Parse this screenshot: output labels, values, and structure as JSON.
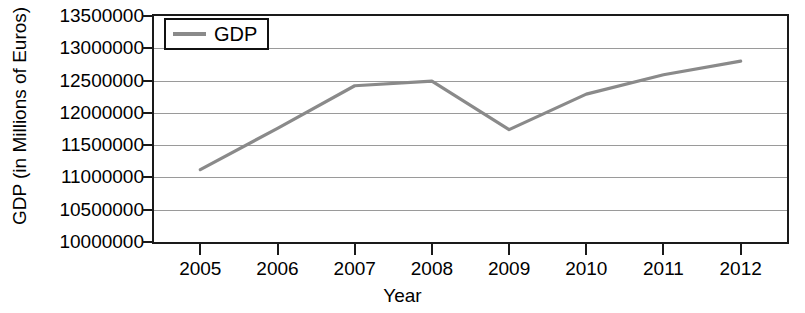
{
  "chart_data": {
    "type": "line",
    "title": "",
    "xlabel": "Year",
    "ylabel": "GDP (in Millions of Euros)",
    "categories": [
      "2005",
      "2006",
      "2007",
      "2008",
      "2009",
      "2010",
      "2011",
      "2012"
    ],
    "x": [
      2005,
      2006,
      2007,
      2008,
      2009,
      2010,
      2011,
      2012
    ],
    "series": [
      {
        "name": "GDP",
        "color": "#8a8a8a",
        "values": [
          11120000,
          11760000,
          12420000,
          12490000,
          11740000,
          12290000,
          12590000,
          12800000
        ]
      }
    ],
    "ylim": [
      10000000,
      13500000
    ],
    "ytick_values": [
      13500000,
      13000000,
      12500000,
      12000000,
      11500000,
      11000000,
      10500000,
      10000000
    ],
    "ytick_labels": [
      "13500000",
      "13000000",
      "12500000",
      "12000000",
      "11500000",
      "11000000",
      "10500000",
      "10000000"
    ],
    "xlim": [
      2004.4,
      2012.6
    ],
    "grid": "horizontal",
    "legend_position": "top-left",
    "legend_entries": [
      "GDP"
    ]
  },
  "axes": {
    "y_title": "GDP (in Millions of Euros)",
    "x_title": "Year"
  },
  "legend": {
    "entries": [
      {
        "label": "GDP",
        "color": "#8a8a8a"
      }
    ]
  },
  "colors": {
    "series_gray": "#8a8a8a",
    "frame": "#1a1a1a",
    "gridline": "#9a9a9a",
    "background": "#ffffff",
    "text": "#000000"
  }
}
